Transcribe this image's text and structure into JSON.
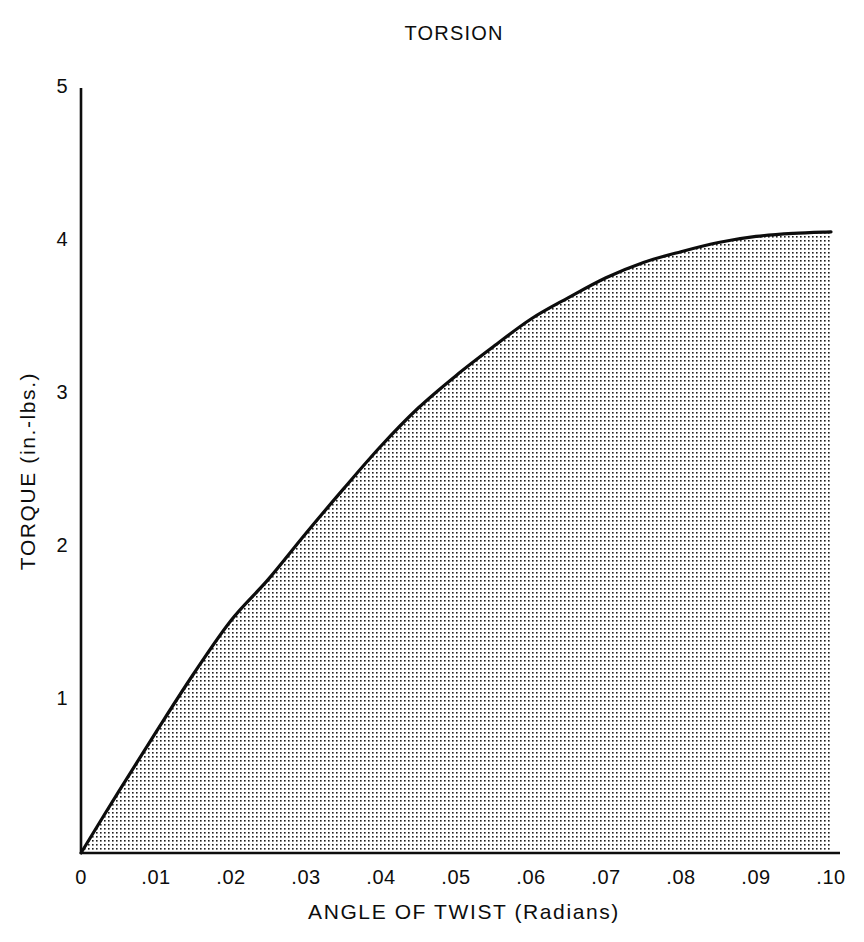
{
  "chart_data": {
    "type": "area",
    "title": "TORSION",
    "xlabel": "ANGLE OF TWIST (Radians)",
    "ylabel": "TORQUE (in.-lbs.)",
    "xlim": [
      0,
      0.1
    ],
    "ylim": [
      0,
      5
    ],
    "xticks": [
      "0",
      ".01",
      ".02",
      ".03",
      ".04",
      ".05",
      ".06",
      ".07",
      ".08",
      ".09",
      ".10"
    ],
    "xtick_values": [
      0,
      0.01,
      0.02,
      0.03,
      0.04,
      0.05,
      0.06,
      0.07,
      0.08,
      0.09,
      0.1
    ],
    "yticks": [
      "1",
      "2",
      "3",
      "4",
      "5"
    ],
    "ytick_values": [
      1,
      2,
      3,
      4,
      5
    ],
    "grid": false,
    "legend": "none",
    "fill": "stipple-dot-pattern",
    "fill_color": "#1a1a1a",
    "line_color": "#0d0d0d",
    "axis_color": "#0d0d0d",
    "background": "#ffffff",
    "series": [
      {
        "name": "Torque vs angle of twist",
        "x": [
          0.0,
          0.005,
          0.01,
          0.015,
          0.02,
          0.025,
          0.03,
          0.035,
          0.04,
          0.045,
          0.05,
          0.055,
          0.06,
          0.065,
          0.07,
          0.075,
          0.08,
          0.085,
          0.09,
          0.095,
          0.1
        ],
        "y": [
          0.0,
          0.4,
          0.79,
          1.17,
          1.52,
          1.79,
          2.09,
          2.38,
          2.66,
          2.91,
          3.12,
          3.31,
          3.49,
          3.63,
          3.76,
          3.86,
          3.93,
          3.99,
          4.03,
          4.05,
          4.06
        ]
      }
    ],
    "annotations": []
  }
}
